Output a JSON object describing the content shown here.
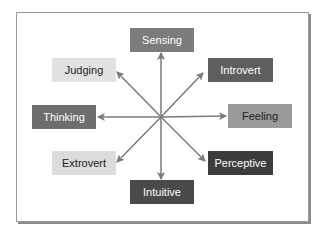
{
  "diagram": {
    "center": {
      "x": 161,
      "y": 117
    },
    "arrow_color": "#7a7a7a",
    "nodes": [
      {
        "id": "sensing",
        "label": "Sensing",
        "x": 130,
        "y": 28,
        "w": 64,
        "h": 24,
        "bg": "#7c7c7c",
        "fg": "#ffffff",
        "tip": [
          161,
          53
        ]
      },
      {
        "id": "introvert",
        "label": "Introvert",
        "x": 208,
        "y": 58,
        "w": 65,
        "h": 24,
        "bg": "#5e5e5e",
        "fg": "#ffffff",
        "tip": [
          203,
          73
        ]
      },
      {
        "id": "feeling",
        "label": "Feeling",
        "x": 228,
        "y": 104,
        "w": 64,
        "h": 24,
        "bg": "#9a9a9a",
        "fg": "#222222",
        "tip": [
          226,
          116
        ]
      },
      {
        "id": "perceptive",
        "label": "Perceptive",
        "x": 208,
        "y": 151,
        "w": 65,
        "h": 24,
        "bg": "#3c3c3c",
        "fg": "#ffffff",
        "tip": [
          205,
          161
        ]
      },
      {
        "id": "intuitive",
        "label": "Intuitive",
        "x": 130,
        "y": 180,
        "w": 64,
        "h": 24,
        "bg": "#4a4a4a",
        "fg": "#ffffff",
        "tip": [
          161,
          179
        ]
      },
      {
        "id": "extrovert",
        "label": "Extrovert",
        "x": 52,
        "y": 151,
        "w": 64,
        "h": 24,
        "bg": "#dcdcdc",
        "fg": "#222222",
        "tip": [
          117,
          162
        ]
      },
      {
        "id": "thinking",
        "label": "Thinking",
        "x": 32,
        "y": 105,
        "w": 64,
        "h": 24,
        "bg": "#6e6e6e",
        "fg": "#ffffff",
        "tip": [
          98,
          117
        ]
      },
      {
        "id": "judging",
        "label": "Judging",
        "x": 52,
        "y": 58,
        "w": 64,
        "h": 24,
        "bg": "#e2e2e2",
        "fg": "#222222",
        "tip": [
          117,
          72
        ]
      }
    ]
  }
}
